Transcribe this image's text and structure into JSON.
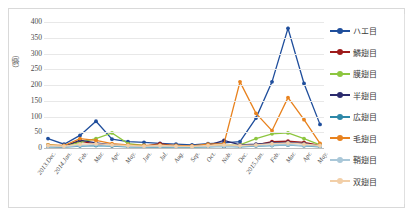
{
  "chart_data": {
    "type": "line",
    "title": "",
    "xlabel": "",
    "ylabel": "（頭）",
    "ylim": [
      0,
      400
    ],
    "yticks": [
      0,
      50,
      100,
      150,
      200,
      250,
      300,
      350,
      400
    ],
    "grid": true,
    "legend_position": "right",
    "categories": [
      "2013.Dec.",
      "2014.Jan.",
      "Feb.",
      "Mar.",
      "Apr.",
      "May.",
      "Jun.",
      "Jul.",
      "Aug.",
      "Sep.",
      "Oct.",
      "Nob.",
      "Dec.",
      "2015.Jan.",
      "Feb.",
      "Mar.",
      "Apr.",
      "May."
    ],
    "series": [
      {
        "name": "ハエ目",
        "color": "#1f4e9c",
        "values": [
          30,
          12,
          40,
          85,
          28,
          20,
          18,
          15,
          12,
          10,
          14,
          16,
          20,
          95,
          210,
          380,
          205,
          75
        ]
      },
      {
        "name": "鱗翅目",
        "color": "#9e1b1b",
        "values": [
          6,
          4,
          22,
          12,
          8,
          6,
          5,
          14,
          6,
          5,
          7,
          6,
          8,
          10,
          20,
          22,
          18,
          8
        ]
      },
      {
        "name": "膜翅目",
        "color": "#8dc63f",
        "values": [
          10,
          6,
          18,
          30,
          48,
          14,
          8,
          6,
          5,
          4,
          6,
          8,
          10,
          30,
          45,
          48,
          30,
          10
        ]
      },
      {
        "name": "半翅目",
        "color": "#2b2b6e",
        "values": [
          8,
          5,
          25,
          16,
          10,
          7,
          6,
          10,
          6,
          5,
          8,
          24,
          10,
          12,
          16,
          18,
          14,
          7
        ]
      },
      {
        "name": "広翅目",
        "color": "#2e88a8",
        "values": [
          4,
          3,
          6,
          8,
          6,
          4,
          3,
          4,
          3,
          3,
          4,
          5,
          4,
          6,
          8,
          9,
          7,
          4
        ]
      },
      {
        "name": "毛翅目",
        "color": "#e8821e",
        "values": [
          10,
          8,
          30,
          24,
          14,
          10,
          8,
          10,
          8,
          7,
          12,
          14,
          210,
          110,
          55,
          160,
          90,
          15
        ]
      },
      {
        "name": "鞘翅目",
        "color": "#a9c7d8",
        "values": [
          5,
          4,
          8,
          10,
          8,
          5,
          4,
          5,
          4,
          4,
          5,
          6,
          5,
          7,
          9,
          10,
          8,
          5
        ]
      },
      {
        "name": "双翅目",
        "color": "#f2cfa8",
        "values": [
          8,
          6,
          12,
          14,
          10,
          8,
          6,
          8,
          6,
          5,
          8,
          10,
          8,
          10,
          14,
          16,
          12,
          8
        ]
      }
    ]
  }
}
